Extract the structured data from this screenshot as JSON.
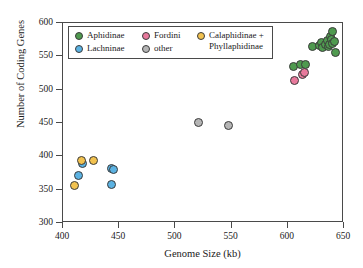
{
  "chart_data": {
    "type": "scatter",
    "title": "",
    "xlabel": "Genome Size (kb)",
    "ylabel": "Number of Coding Genes",
    "xlim": [
      400,
      650
    ],
    "ylim": [
      300,
      600
    ],
    "xticks": [
      400,
      450,
      500,
      550,
      600,
      650
    ],
    "yticks": [
      300,
      350,
      400,
      450,
      500,
      550,
      600
    ],
    "grid": false,
    "legend_position": "top-left-inside",
    "series": [
      {
        "name": "Aphidinae",
        "color": "#4f9a4f",
        "points": [
          [
            606,
            533
          ],
          [
            612,
            536
          ],
          [
            617,
            537
          ],
          [
            623,
            563
          ],
          [
            629,
            565
          ],
          [
            631,
            570
          ],
          [
            632,
            562
          ],
          [
            634,
            566
          ],
          [
            636,
            572
          ],
          [
            637,
            563
          ],
          [
            638,
            567
          ],
          [
            639,
            578
          ],
          [
            640,
            574
          ],
          [
            641,
            586
          ],
          [
            641,
            568
          ],
          [
            642,
            571
          ],
          [
            643,
            554
          ]
        ]
      },
      {
        "name": "Lachninae",
        "color": "#5bb2e2",
        "points": [
          [
            415,
            370
          ],
          [
            418,
            388
          ],
          [
            444,
            380
          ],
          [
            446,
            379
          ],
          [
            444,
            357
          ]
        ]
      },
      {
        "name": "Fordini",
        "color": "#e8799c",
        "points": [
          [
            607,
            512
          ],
          [
            614,
            521
          ],
          [
            616,
            525
          ]
        ]
      },
      {
        "name": "other",
        "color": "#b5b5b5",
        "points": [
          [
            521,
            449
          ],
          [
            548,
            445
          ]
        ]
      },
      {
        "name": "Calaphidinae + Phyllaphidinae",
        "color": "#f2c24f",
        "points": [
          [
            411,
            355
          ],
          [
            417,
            392
          ],
          [
            428,
            393
          ]
        ]
      }
    ]
  },
  "legend": {
    "entries": [
      {
        "label": "Aphidinae",
        "color": "#4f9a4f"
      },
      {
        "label": "Lachninae",
        "color": "#5bb2e2"
      },
      {
        "label": "Fordini",
        "color": "#e8799c"
      },
      {
        "label": "other",
        "color": "#b5b5b5"
      },
      {
        "label": "Calaphidinae +\nPhyllaphidinae",
        "color": "#f2c24f"
      }
    ]
  }
}
